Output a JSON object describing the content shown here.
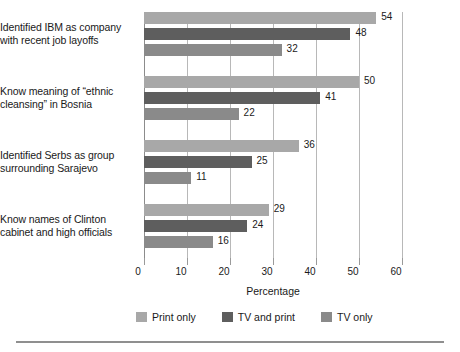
{
  "chart_data": {
    "type": "bar",
    "orientation": "horizontal",
    "title": "",
    "xlabel": "Percentage",
    "ylabel": "",
    "xlim": [
      0,
      60
    ],
    "xticks": [
      0,
      10,
      20,
      30,
      40,
      50,
      60
    ],
    "xtick_labels": [
      "0",
      "10",
      "20",
      "30",
      "40",
      "50",
      "60"
    ],
    "grid": true,
    "grid_axis": "x",
    "legend_position": "bottom",
    "categories": [
      "Identified IBM as company with recent job layoffs",
      "Know meaning of “ethnic cleansing” in Bosnia",
      "Identified Serbs as group surrounding Sarajevo",
      "Know names of Clinton cabinet and high officials"
    ],
    "category_lines": [
      [
        "Identified IBM as company",
        "with recent job layoffs"
      ],
      [
        "Know meaning of “ethnic",
        "cleansing” in Bosnia"
      ],
      [
        "Identified Serbs as group",
        "surrounding Sarajevo"
      ],
      [
        "Know names of Clinton",
        "cabinet and high officials"
      ]
    ],
    "series": [
      {
        "name": "Print only",
        "color": "#a8a8a8",
        "values": [
          54,
          50,
          36,
          29
        ],
        "value_labels": [
          "54",
          "50",
          "36",
          "29"
        ]
      },
      {
        "name": "TV and print",
        "color": "#5e5e5e",
        "values": [
          48,
          41,
          25,
          24
        ],
        "value_labels": [
          "48",
          "41",
          "25",
          "24"
        ]
      },
      {
        "name": "TV only",
        "color": "#8a8a8a",
        "values": [
          32,
          22,
          11,
          16
        ],
        "value_labels": [
          "32",
          "22",
          "11",
          "16"
        ]
      }
    ]
  },
  "legend": {
    "items": [
      {
        "label": "Print only",
        "color": "#a8a8a8"
      },
      {
        "label": "TV and print",
        "color": "#5e5e5e"
      },
      {
        "label": "TV only",
        "color": "#8a8a8a"
      }
    ]
  },
  "axis": {
    "title": "Percentage"
  }
}
